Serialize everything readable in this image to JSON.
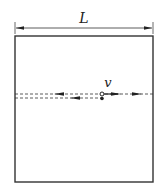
{
  "diagram": {
    "width_label": "L",
    "velocity_label": "v",
    "colors": {
      "stroke": "#333333",
      "background": "#ffffff"
    },
    "box": {
      "x": 15,
      "y": 36,
      "w": 138,
      "h": 146
    },
    "dimension": {
      "y": 28,
      "x1": 15,
      "x2": 153
    },
    "paths": [
      {
        "name": "upper-dashed-path",
        "y": 94,
        "x1": 15,
        "x2": 153,
        "arrows": [
          "left",
          "right",
          "right"
        ]
      },
      {
        "name": "lower-dashed-path",
        "y": 98,
        "x1": 15,
        "x2": 102,
        "arrows": [
          "left"
        ]
      }
    ],
    "points": [
      {
        "name": "open-circle-particle",
        "x": 102,
        "y": 94,
        "filled": false
      },
      {
        "name": "filled-dot-particle",
        "x": 102,
        "y": 98,
        "filled": true
      }
    ]
  }
}
